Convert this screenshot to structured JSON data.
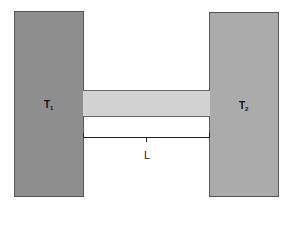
{
  "diagram": {
    "blocks": [
      {
        "id": "t1",
        "label": "T",
        "subscript": "1",
        "color": "#8e8e8e"
      },
      {
        "id": "t2",
        "label": "T",
        "subscript": "2",
        "color": "#ababab"
      }
    ],
    "rod": {
      "color": "#d2d2d2"
    },
    "dimension": {
      "label": "L"
    }
  }
}
